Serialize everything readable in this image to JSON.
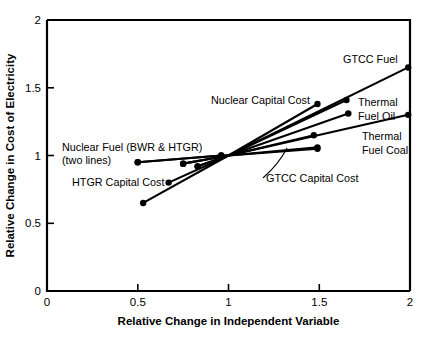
{
  "chart_data": {
    "type": "line",
    "title": "",
    "xlabel": "Relative Change in Independent Variable",
    "ylabel": "Relative Change in Cost of Electricity",
    "xlim": [
      0,
      2
    ],
    "ylim": [
      0,
      2
    ],
    "xticks": [
      "0",
      "0.5",
      "1",
      "1.5",
      "2"
    ],
    "xtick_values": [
      0,
      0.5,
      1,
      1.5,
      2
    ],
    "yticks": [
      "0",
      "0.5",
      "1",
      "1.5",
      "2"
    ],
    "ytick_values": [
      0,
      0.5,
      1,
      1.5,
      2
    ],
    "grid": false,
    "legend": "none",
    "marker": "filled-circle",
    "series": [
      {
        "name": "GTCC Fuel",
        "x": [
          0.53,
          1.0,
          1.99
        ],
        "y": [
          0.65,
          1.0,
          1.65
        ]
      },
      {
        "name": "Nuclear Capital Cost",
        "x": [
          0.67,
          1.0,
          1.49
        ],
        "y": [
          0.8,
          1.0,
          1.38
        ]
      },
      {
        "name": "Thermal Fuel Oil",
        "x": [
          0.83,
          1.0,
          1.65
        ],
        "y": [
          0.92,
          1.0,
          1.41
        ]
      },
      {
        "name": "Thermal Fuel Oil (second)",
        "x": [
          0.83,
          1.0,
          1.66
        ],
        "y": [
          0.92,
          1.0,
          1.31
        ]
      },
      {
        "name": "Thermal Fuel Coal",
        "x": [
          0.75,
          1.0,
          1.99
        ],
        "y": [
          0.94,
          1.0,
          1.3
        ]
      },
      {
        "name": "GTCC Capital Cost",
        "x": [
          0.75,
          1.0,
          1.47
        ],
        "y": [
          0.94,
          1.0,
          1.15
        ]
      },
      {
        "name": "Nuclear Fuel (BWR)",
        "x": [
          0.5,
          0.96,
          1.0,
          1.49
        ],
        "y": [
          0.95,
          1.0,
          1.0,
          1.06
        ]
      },
      {
        "name": "Nuclear Fuel (HTGR)",
        "x": [
          0.5,
          0.96,
          1.0,
          1.49
        ],
        "y": [
          0.95,
          1.0,
          1.0,
          1.05
        ]
      }
    ],
    "annotations": [
      {
        "id": "gtcc-fuel",
        "text": "GTCC Fuel"
      },
      {
        "id": "nuclear-capital-cost",
        "text": "Nuclear Capital Cost"
      },
      {
        "id": "thermal",
        "text": "Thermal"
      },
      {
        "id": "fuel-oil",
        "text": "Fuel Oil"
      },
      {
        "id": "thermal-2",
        "text": "Thermal"
      },
      {
        "id": "fuel-coal",
        "text": "Fuel Coal"
      },
      {
        "id": "nuclear-fuel",
        "text": "Nuclear Fuel (BWR & HTGR)"
      },
      {
        "id": "two-lines",
        "text": "(two lines)"
      },
      {
        "id": "htgr-capital-cost",
        "text": "HTGR Capital Cost"
      },
      {
        "id": "gtcc-capital-cost",
        "text": "GTCC Capital Cost"
      }
    ]
  },
  "axis": {
    "x_title": "Relative Change in Independent Variable",
    "y_title": "Relative Change in Cost of Electricity",
    "x_tick_0": "0",
    "x_tick_1": "0.5",
    "x_tick_2": "1",
    "x_tick_3": "1.5",
    "x_tick_4": "2",
    "y_tick_0": "0",
    "y_tick_1": "0.5",
    "y_tick_2": "1",
    "y_tick_3": "1.5",
    "y_tick_4": "2"
  },
  "labels": {
    "gtcc_fuel": "GTCC Fuel",
    "nuclear_capital_cost": "Nuclear Capital Cost",
    "thermal": "Thermal",
    "fuel_oil": "Fuel Oil",
    "thermal_2": "Thermal",
    "fuel_coal": "Fuel Coal",
    "nuclear_fuel": "Nuclear Fuel (BWR & HTGR)",
    "two_lines": "(two lines)",
    "htgr_capital_cost": "HTGR Capital Cost",
    "gtcc_capital_cost": "GTCC Capital Cost"
  },
  "colors": {
    "ink": "#000000",
    "background": "#ffffff"
  }
}
